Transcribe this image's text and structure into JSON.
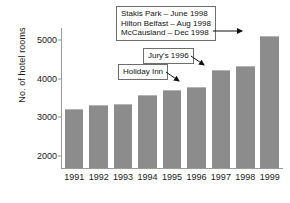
{
  "chart_data": {
    "type": "bar",
    "title": "",
    "xlabel": "",
    "ylabel": "No. of hotel rooms",
    "categories": [
      "1991",
      "1992",
      "1993",
      "1994",
      "1995",
      "1996",
      "1997",
      "1998",
      "1999"
    ],
    "values": [
      3230,
      3330,
      3350,
      3570,
      3700,
      3780,
      4220,
      4330,
      5100
    ],
    "ylim": [
      1700,
      5300
    ],
    "yticks": [
      2000,
      3000,
      4000,
      5000
    ],
    "ytick_labels": [
      "2000",
      "3000",
      "4000",
      "5000"
    ],
    "grid": false,
    "legend": "none",
    "bar_color": "#8c8c8c",
    "axis_color": "#9a9a9a",
    "annotations": [
      {
        "id": "multi",
        "lines": [
          "Stakis Park – June 1998",
          "Hilton Belfast – Aug 1998",
          "McCausland – Dec 1998"
        ],
        "points_to": "1999"
      },
      {
        "id": "jurys",
        "lines": [
          "Jury's 1996"
        ],
        "points_to": "1996"
      },
      {
        "id": "holiday",
        "lines": [
          "Holiday Inn"
        ],
        "points_to": "1996"
      }
    ]
  }
}
